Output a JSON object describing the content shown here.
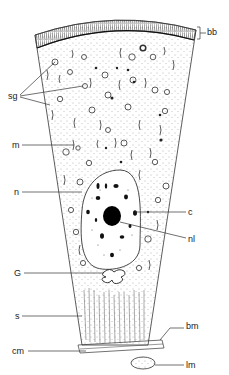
{
  "diagram": {
    "type": "labeled-cell-illustration",
    "colors": {
      "ink": "#222222",
      "background": "#ffffff",
      "stipple": "#555555"
    },
    "labels": [
      {
        "id": "bb",
        "text": "bb",
        "x": 207,
        "y": 28
      },
      {
        "id": "sg",
        "text": "sg",
        "x": 8,
        "y": 92
      },
      {
        "id": "m",
        "text": "m",
        "x": 12,
        "y": 141
      },
      {
        "id": "n",
        "text": "n",
        "x": 14,
        "y": 188
      },
      {
        "id": "c",
        "text": "c",
        "x": 188,
        "y": 208
      },
      {
        "id": "nl",
        "text": "nl",
        "x": 188,
        "y": 235
      },
      {
        "id": "G",
        "text": "G",
        "x": 14,
        "y": 269
      },
      {
        "id": "s",
        "text": "s",
        "x": 15,
        "y": 312
      },
      {
        "id": "bm",
        "text": "bm",
        "x": 186,
        "y": 325
      },
      {
        "id": "cm",
        "text": "cm",
        "x": 12,
        "y": 348
      },
      {
        "id": "lm",
        "text": "lm",
        "x": 186,
        "y": 362
      }
    ]
  }
}
